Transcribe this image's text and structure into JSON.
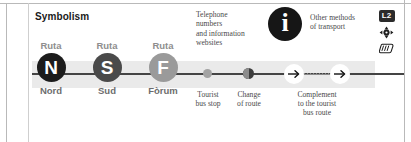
{
  "panel": {
    "title": "Symbolism"
  },
  "routes": [
    {
      "tag": "Ruta",
      "letter": "N",
      "name": "Nord",
      "color": "#1c1c1c"
    },
    {
      "tag": "Ruta",
      "letter": "S",
      "name": "Sud",
      "color": "#4a4a4a"
    },
    {
      "tag": "Ruta",
      "letter": "F",
      "name": "Fòrum",
      "color": "#9a9a9a"
    }
  ],
  "markers": [
    {
      "icon": "tourist-bus-stop-dot",
      "caption_line1": "Tourist",
      "caption_line2": "bus stop"
    },
    {
      "icon": "change-of-route-dot",
      "caption_line1": "Change",
      "caption_line2": "of route"
    }
  ],
  "complement": {
    "icon": "arrow-right-circle",
    "caption_line1": "Complement",
    "caption_line2": "to the tourist",
    "caption_line3": "bus route"
  },
  "telephone": {
    "line1": "Telephone",
    "line2": "numbers",
    "line3": "and information",
    "line4": "websites",
    "icon": "information-icon",
    "icon_glyph": "i"
  },
  "other_transport": {
    "line1": "Other methods",
    "line2": "of transport",
    "icons": [
      {
        "name": "metro-line-badge",
        "label": "L2"
      },
      {
        "name": "funicular-icon",
        "label": ""
      },
      {
        "name": "tram-icon",
        "label": ""
      }
    ]
  }
}
